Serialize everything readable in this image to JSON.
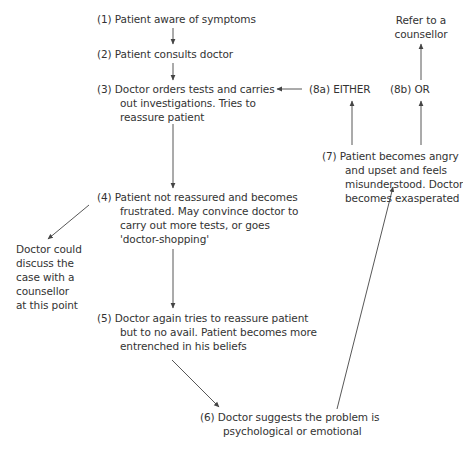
{
  "diagram": {
    "nodes": {
      "n1": {
        "num": "(1)",
        "lines": [
          "Patient aware of symptoms"
        ]
      },
      "n2": {
        "num": "(2)",
        "lines": [
          "Patient consults doctor"
        ]
      },
      "n3": {
        "num": "(3)",
        "lines": [
          "Doctor orders tests and carries",
          "out investigations. Tries to",
          "reassure patient"
        ]
      },
      "n4": {
        "num": "(4)",
        "lines": [
          "Patient not reassured and becomes",
          "frustrated. May convince doctor to",
          "carry out more tests, or goes",
          "'doctor-shopping'"
        ]
      },
      "n5": {
        "num": "(5)",
        "lines": [
          "Doctor again tries to reassure patient",
          "but to no avail. Patient becomes more",
          "entrenched in his beliefs"
        ]
      },
      "n6": {
        "num": "(6)",
        "lines": [
          "Doctor suggests the problem is",
          "psychological or emotional"
        ]
      },
      "n7": {
        "num": "(7)",
        "lines": [
          "Patient becomes angry",
          "and upset and feels",
          "misunderstood. Doctor",
          "becomes exasperated"
        ]
      },
      "n8a": {
        "num": "(8a)",
        "lines": [
          "EITHER"
        ]
      },
      "n8b": {
        "num": "(8b)",
        "lines": [
          "OR"
        ]
      },
      "refer": {
        "lines": [
          "Refer to a",
          "counsellor"
        ]
      },
      "side": {
        "lines": [
          "Doctor could",
          "discuss the",
          "case with a",
          "counsellor",
          "at this point"
        ]
      }
    },
    "edges": [
      {
        "from": "n1",
        "to": "n2"
      },
      {
        "from": "n2",
        "to": "n3"
      },
      {
        "from": "n3",
        "to": "n4"
      },
      {
        "from": "n4",
        "to": "side"
      },
      {
        "from": "n4",
        "to": "n5"
      },
      {
        "from": "n5",
        "to": "n6"
      },
      {
        "from": "n6",
        "to": "n7"
      },
      {
        "from": "n7",
        "to": "n8a"
      },
      {
        "from": "n7",
        "to": "n8b"
      },
      {
        "from": "n8a",
        "to": "n3"
      },
      {
        "from": "n8b",
        "to": "refer"
      }
    ]
  }
}
